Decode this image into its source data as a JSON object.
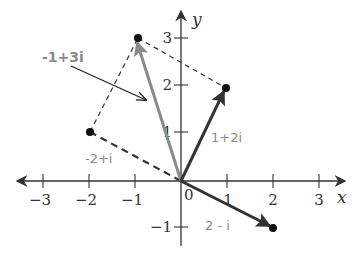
{
  "diagram": {
    "origin_px": [
      181,
      181
    ],
    "unit_px": 46,
    "axes": {
      "x_label": "x",
      "y_label": "y",
      "x_ticks": [
        {
          "value": -3,
          "label": "−3"
        },
        {
          "value": -2,
          "label": "−2"
        },
        {
          "value": -1,
          "label": "−1"
        },
        {
          "value": 1,
          "label": "1"
        },
        {
          "value": 2,
          "label": "2"
        },
        {
          "value": 3,
          "label": "3"
        }
      ],
      "y_ticks": [
        {
          "value": 3,
          "label": "3"
        },
        {
          "value": 2,
          "label": "2"
        },
        {
          "value": 1,
          "label": "1"
        },
        {
          "value": -1,
          "label": "−1"
        }
      ],
      "origin_label": "0"
    },
    "vectors": [
      {
        "id": "v1",
        "label": "1+2i",
        "re": 1,
        "im": 2,
        "color": "#333333"
      },
      {
        "id": "v2",
        "label": "2 - i",
        "re": 2,
        "im": -1,
        "color": "#333333"
      },
      {
        "id": "v3",
        "label": "-1+3i",
        "re": -1,
        "im": 3,
        "color": "#8a8a8a"
      }
    ],
    "dashed_points": [
      {
        "id": "p1",
        "label": "-2+i",
        "re": -2,
        "im": 1
      }
    ],
    "labels": {
      "v1": "1+2i",
      "v2": "2 - i",
      "v3": "-1+3i",
      "p1": "-2+i"
    },
    "colors": {
      "axis": "#333333",
      "dark_vector": "#333333",
      "gray_vector": "#8a8a8a",
      "label_gray": "#8a8a8a"
    }
  }
}
